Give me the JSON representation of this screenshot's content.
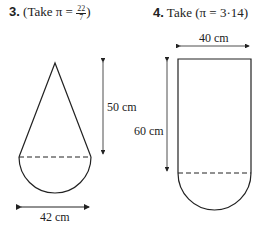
{
  "problems": [
    {
      "number": "3.",
      "instruction_prefix": "(Take π =",
      "pi_numerator": "22",
      "pi_denominator": "7",
      "instruction_suffix": ")",
      "figure": "cone-on-hemisphere",
      "height_label": "50 cm",
      "diameter_label": "42 cm"
    },
    {
      "number": "4.",
      "instruction": "Take (π = 3·14)",
      "figure": "cylinder-on-hemisphere",
      "width_label": "40 cm",
      "height_label": "60 cm"
    }
  ]
}
